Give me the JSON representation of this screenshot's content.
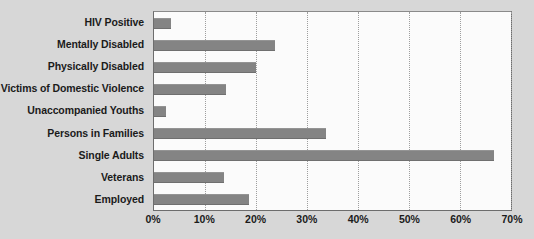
{
  "chart_data": {
    "type": "bar",
    "orientation": "horizontal",
    "title": "",
    "subtitle": "",
    "xlabel": "",
    "ylabel": "",
    "categories": [
      "HIV Positive",
      "Mentally Disabled",
      "Physically Disabled",
      "Victims of Domestic Violence",
      "Unaccompanied Youths",
      "Persons in Families",
      "Single Adults",
      "Veterans",
      "Employed"
    ],
    "values": [
      3.3,
      23.8,
      20.0,
      14.2,
      2.3,
      33.7,
      66.7,
      13.8,
      18.7
    ],
    "value_unit": "%",
    "xlim": [
      0,
      70
    ],
    "tick_labels": [
      "0%",
      "10%",
      "20%",
      "30%",
      "40%",
      "50%",
      "60%",
      "70%"
    ],
    "tick_values": [
      0,
      10,
      20,
      30,
      40,
      50,
      60,
      70
    ],
    "grid": true,
    "grid_axis": "x",
    "grid_style": "dotted",
    "legend": false,
    "bar_color": "#848484",
    "plot_background": "#fbfbfb",
    "figure_background": "#d7d7d7",
    "text_color": "#1b1b1b"
  }
}
